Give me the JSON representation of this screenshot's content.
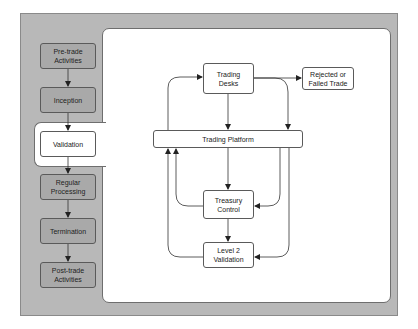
{
  "lifecycle": {
    "stages": [
      {
        "label": "Pre-trade\nActivities",
        "active": false
      },
      {
        "label": "Inception",
        "active": false
      },
      {
        "label": "Validation",
        "active": true
      },
      {
        "label": "Regular\nProcessing",
        "active": false
      },
      {
        "label": "Termination",
        "active": false
      },
      {
        "label": "Post-trade\nActivities",
        "active": false
      }
    ]
  },
  "validation_detail": {
    "nodes": {
      "trading_desks": "Trading\nDesks",
      "rejected": "Rejected or\nFailed Trade",
      "trading_platform": "Trading Platform",
      "treasury_control": "Treasury\nControl",
      "level2_validation": "Level 2\nValidation"
    },
    "edges": [
      {
        "from": "trading_platform",
        "to": "trading_desks"
      },
      {
        "from": "trading_desks",
        "to": "trading_platform"
      },
      {
        "from": "trading_desks",
        "to": "rejected"
      },
      {
        "from": "trading_desks",
        "to": "trading_platform"
      },
      {
        "from": "trading_platform",
        "to": "treasury_control"
      },
      {
        "from": "trading_platform",
        "to": "treasury_control"
      },
      {
        "from": "trading_platform",
        "to": "level2_validation"
      },
      {
        "from": "treasury_control",
        "to": "trading_platform"
      },
      {
        "from": "treasury_control",
        "to": "level2_validation"
      },
      {
        "from": "level2_validation",
        "to": "trading_platform"
      }
    ]
  },
  "colors": {
    "panel": "#b8b8b8",
    "stage_box": "#a9a9a9",
    "active_box": "#ffffff",
    "line": "#333333"
  }
}
